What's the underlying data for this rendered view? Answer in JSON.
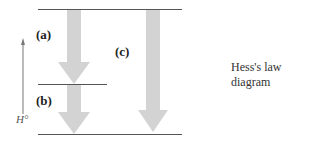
{
  "diagram": {
    "caption": "Hess's law diagram",
    "axis_label": "H°",
    "labels": {
      "a": "(a)",
      "b": "(b)",
      "c": "(c)"
    },
    "colors": {
      "arrow": "#d3d3d3",
      "line": "#555555",
      "axis": "#777777"
    }
  }
}
